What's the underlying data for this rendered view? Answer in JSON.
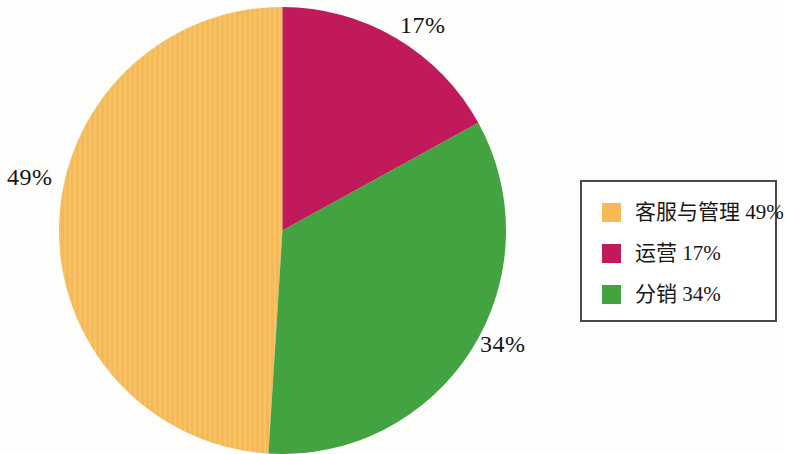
{
  "background_color": "#fdfdfc",
  "chart_data": {
    "type": "pie",
    "title": "",
    "subtitle": "",
    "xlabel": "",
    "ylabel": "",
    "grid": false,
    "legend_position": "right",
    "start_angle_deg": 0,
    "direction": "clockwise",
    "categories": [
      "客服与管理",
      "运营",
      "分销"
    ],
    "values": [
      49,
      17,
      34
    ],
    "value_unit": "%",
    "colors": [
      "#f5b955",
      "#c11a5b",
      "#42a340"
    ],
    "slices": [
      {
        "label": "客服与管理",
        "value": 49,
        "value_text": "49%",
        "legend_text": "客服与管理 49%",
        "color": "#f5b955",
        "start_deg": 183.6,
        "end_deg": 360
      },
      {
        "label": "运营",
        "value": 17,
        "value_text": "17%",
        "legend_text": "运营 17%",
        "color": "#c11a5b",
        "start_deg": 0,
        "end_deg": 61.2
      },
      {
        "label": "分销",
        "value": 34,
        "value_text": "34%",
        "legend_text": "分销 34%",
        "color": "#42a340",
        "start_deg": 61.2,
        "end_deg": 183.6
      }
    ],
    "data_labels": [
      {
        "text": "17%",
        "series": "运营"
      },
      {
        "text": "49%",
        "series": "客服与管理"
      },
      {
        "text": "34%",
        "series": "分销"
      }
    ]
  },
  "legend": {
    "border_color": "#4a4a4a",
    "items": [
      {
        "text": "客服与管理 49%",
        "color": "#f5b955",
        "swatch_name": "legend-swatch-customer-service"
      },
      {
        "text": "运营 17%",
        "color": "#c11a5b",
        "swatch_name": "legend-swatch-operations"
      },
      {
        "text": "分销 34%",
        "color": "#42a340",
        "swatch_name": "legend-swatch-distribution"
      }
    ]
  }
}
